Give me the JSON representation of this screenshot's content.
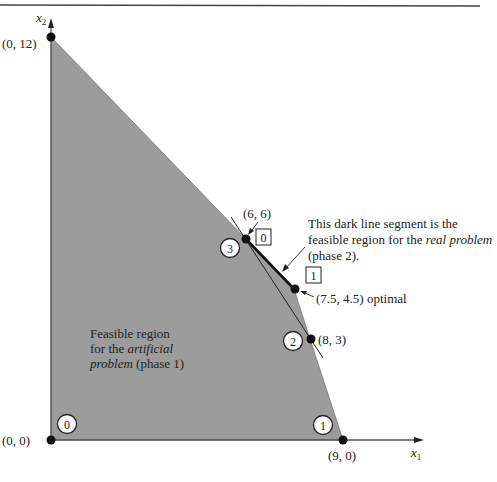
{
  "colors": {
    "region_fill": "#9c9c9c",
    "line": "#222222",
    "axis": "#555555",
    "top_rule": "#444444"
  },
  "axes": {
    "x_label": "x",
    "x_sub": "1",
    "y_label": "x",
    "y_sub": "2"
  },
  "points": [
    {
      "label": "(0, 12)",
      "x": 0,
      "y": 12
    },
    {
      "label": "(0, 0)",
      "x": 0,
      "y": 0
    },
    {
      "label": "(9, 0)",
      "x": 9,
      "y": 0
    },
    {
      "label": "(6, 6)",
      "x": 6,
      "y": 6
    },
    {
      "label": "(7.5, 4.5) optimal",
      "x": 7.5,
      "y": 4.5
    },
    {
      "label": "(8, 3)",
      "x": 8,
      "y": 3
    }
  ],
  "circled_markers": [
    "0",
    "1",
    "2",
    "3"
  ],
  "boxed_markers": [
    "0",
    "1"
  ],
  "annotations": {
    "real": {
      "line1": "This dark line segment is the",
      "line2_pre": "feasible region for the ",
      "line2_em": "real problem",
      "line3": "(phase 2)."
    },
    "artificial": {
      "line1": "Feasible region",
      "line2_pre": "for the ",
      "line2_em": "artificial",
      "line3_em": "problem",
      "line3_post": " (phase 1)"
    }
  }
}
